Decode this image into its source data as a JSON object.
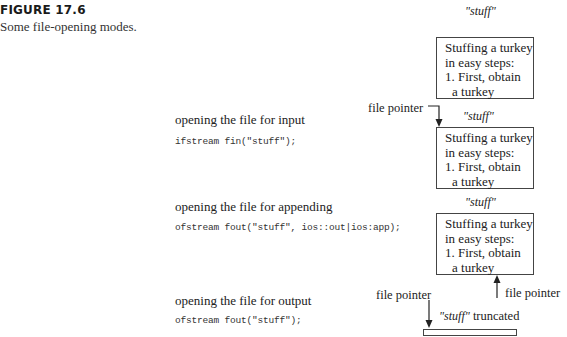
{
  "figure": {
    "label": "FIGURE 17.6",
    "caption": "Some file-opening modes."
  },
  "file_contents": {
    "lines": [
      "Stuffing a turkey",
      "in easy steps:",
      "1. First, obtain",
      "a turkey"
    ]
  },
  "file_name_label": "\"stuff\"",
  "modes": [
    {
      "description": "opening the file for input",
      "code": "ifstream fin(\"stuff\");",
      "pointer_label": "file pointer",
      "pointer_position": "start"
    },
    {
      "description": "opening the file for appending",
      "code": "ofstream fout(\"stuff\", ios::out|ios:app);",
      "pointer_label": "file pointer",
      "pointer_position": "end"
    },
    {
      "description": "opening the file for output",
      "code": "ofstream fout(\"stuff\");",
      "pointer_label": "file pointer",
      "pointer_position": "start",
      "file_state": "truncated",
      "file_label_name": "\"stuff\"",
      "file_label_suffix": " truncated"
    }
  ],
  "original_file": {
    "name": "\"stuff\""
  }
}
